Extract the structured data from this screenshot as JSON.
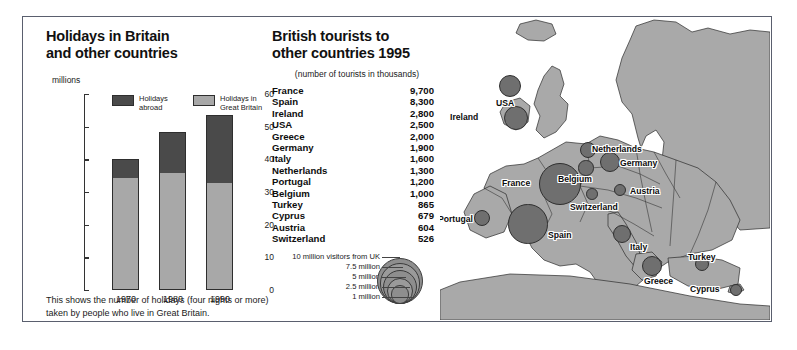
{
  "left": {
    "title_line1": "Holidays in Britain",
    "title_line2": "and other countries",
    "axis_unit": "millions",
    "legend": [
      {
        "label_line1": "Holidays",
        "label_line2": "abroad",
        "color": "#4a4a4a",
        "key": "abroad"
      },
      {
        "label_line1": "Holidays in",
        "label_line2": "Great Britain",
        "color": "#a8a8a8",
        "key": "great_britain"
      }
    ],
    "caption": "This shows the number of holidays (four nights or more) taken by people who live in Great Britain."
  },
  "mid": {
    "title_line1": "British tourists to",
    "title_line2": "other countries 1995",
    "subtitle": "(number of tourists in thousands)",
    "rows": [
      {
        "country": "France",
        "value": "9,700"
      },
      {
        "country": "Spain",
        "value": "8,300"
      },
      {
        "country": "Ireland",
        "value": "2,800"
      },
      {
        "country": "USA",
        "value": "2,500"
      },
      {
        "country": "Greece",
        "value": "2,000"
      },
      {
        "country": "Germany",
        "value": "1,900"
      },
      {
        "country": "Italy",
        "value": "1,600"
      },
      {
        "country": "Netherlands",
        "value": "1,300"
      },
      {
        "country": "Portugal",
        "value": "1,200"
      },
      {
        "country": "Belgium",
        "value": "1,000"
      },
      {
        "country": "Turkey",
        "value": "865"
      },
      {
        "country": "Cyprus",
        "value": "679"
      },
      {
        "country": "Austria",
        "value": "604"
      },
      {
        "country": "Switzerland",
        "value": "526"
      }
    ]
  },
  "size_legend": {
    "items": [
      {
        "label": "10 million visitors from UK",
        "millions": 10
      },
      {
        "label": "7.5 million",
        "millions": 7.5
      },
      {
        "label": "5 million",
        "millions": 5
      },
      {
        "label": "2.5 million",
        "millions": 2.5
      },
      {
        "label": "1 million",
        "millions": 1
      }
    ]
  },
  "map": {
    "labels": [
      {
        "name": "USA",
        "text": "USA"
      },
      {
        "name": "Ireland",
        "text": "Ireland"
      },
      {
        "name": "Netherlands",
        "text": "Netherlands"
      },
      {
        "name": "Germany",
        "text": "Germany"
      },
      {
        "name": "Belgium",
        "text": "Belgium"
      },
      {
        "name": "France",
        "text": "France"
      },
      {
        "name": "Switzerland",
        "text": "Switzerland"
      },
      {
        "name": "Austria",
        "text": "Austria"
      },
      {
        "name": "Portugal",
        "text": "Portugal"
      },
      {
        "name": "Spain",
        "text": "Spain"
      },
      {
        "name": "Italy",
        "text": "Italy"
      },
      {
        "name": "Greece",
        "text": "Greece"
      },
      {
        "name": "Turkey",
        "text": "Turkey"
      },
      {
        "name": "Cyprus",
        "text": "Cyprus"
      }
    ]
  },
  "colors": {
    "bar_abroad": "#4a4a4a",
    "bar_great_britain": "#a8a8a8",
    "bubble": "#6f6f6f",
    "land": "#a9a9a9",
    "sea": "#ffffff",
    "frame": "#5a5f6e"
  },
  "chart_data": [
    {
      "type": "bar",
      "title": "Holidays in Britain and other countries",
      "subtitle": "",
      "xlabel": "",
      "ylabel": "millions",
      "ylim": [
        0,
        60
      ],
      "yticks": [
        0,
        10,
        20,
        30,
        40,
        50,
        60
      ],
      "grid": false,
      "stacked": true,
      "legend_position": "inside-top",
      "categories": [
        "1970",
        "1980",
        "1990"
      ],
      "series": [
        {
          "name": "Holidays in Great Britain",
          "values": [
            34,
            35.5,
            32.5
          ],
          "color": "#a8a8a8"
        },
        {
          "name": "Holidays abroad",
          "values": [
            6,
            13,
            21
          ],
          "color": "#4a4a4a"
        }
      ],
      "totals": [
        40,
        48.5,
        53.5
      ],
      "annotation": "This shows the number of holidays (four nights or more) taken by people who live in Great Britain."
    },
    {
      "type": "table",
      "title": "British tourists to other countries 1995",
      "subtitle": "(number of tourists in thousands)",
      "columns": [
        "Country",
        "Tourists (thousands)"
      ],
      "rows": [
        [
          "France",
          9700
        ],
        [
          "Spain",
          8300
        ],
        [
          "Ireland",
          2800
        ],
        [
          "USA",
          2500
        ],
        [
          "Greece",
          2000
        ],
        [
          "Germany",
          1900
        ],
        [
          "Italy",
          1600
        ],
        [
          "Netherlands",
          1300
        ],
        [
          "Portugal",
          1200
        ],
        [
          "Belgium",
          1000
        ],
        [
          "Turkey",
          865
        ],
        [
          "Cyprus",
          679
        ],
        [
          "Austria",
          604
        ],
        [
          "Switzerland",
          526
        ]
      ]
    },
    {
      "type": "scatter",
      "title": "British tourists to other countries 1995 (map)",
      "subtitle": "Proportional symbol map of Europe",
      "xlabel": "",
      "ylabel": "",
      "grid": false,
      "legend_position": "bottom-left",
      "size_legend_millions": [
        10,
        7.5,
        5,
        2.5,
        1
      ],
      "points": [
        {
          "label": "France",
          "value_thousands": 9700
        },
        {
          "label": "Spain",
          "value_thousands": 8300
        },
        {
          "label": "Ireland",
          "value_thousands": 2800
        },
        {
          "label": "USA",
          "value_thousands": 2500
        },
        {
          "label": "Greece",
          "value_thousands": 2000
        },
        {
          "label": "Germany",
          "value_thousands": 1900
        },
        {
          "label": "Italy",
          "value_thousands": 1600
        },
        {
          "label": "Netherlands",
          "value_thousands": 1300
        },
        {
          "label": "Portugal",
          "value_thousands": 1200
        },
        {
          "label": "Belgium",
          "value_thousands": 1000
        },
        {
          "label": "Turkey",
          "value_thousands": 865
        },
        {
          "label": "Cyprus",
          "value_thousands": 679
        },
        {
          "label": "Austria",
          "value_thousands": 604
        },
        {
          "label": "Switzerland",
          "value_thousands": 526
        }
      ]
    }
  ]
}
